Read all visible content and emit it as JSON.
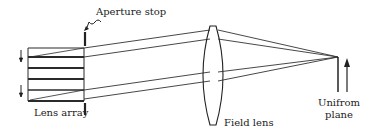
{
  "diagram": {
    "labels": {
      "aperture_stop": "Aperture stop",
      "lens_array": "Lens array",
      "field_lens": "Field lens",
      "uniform_plane_line1": "Unifrom",
      "uniform_plane_line2": "plane"
    },
    "components": [
      "Lens array",
      "Aperture stop",
      "Field lens",
      "Uniform plane"
    ],
    "colors": {
      "line": "#2a2a2a",
      "background": "#ffffff"
    }
  }
}
